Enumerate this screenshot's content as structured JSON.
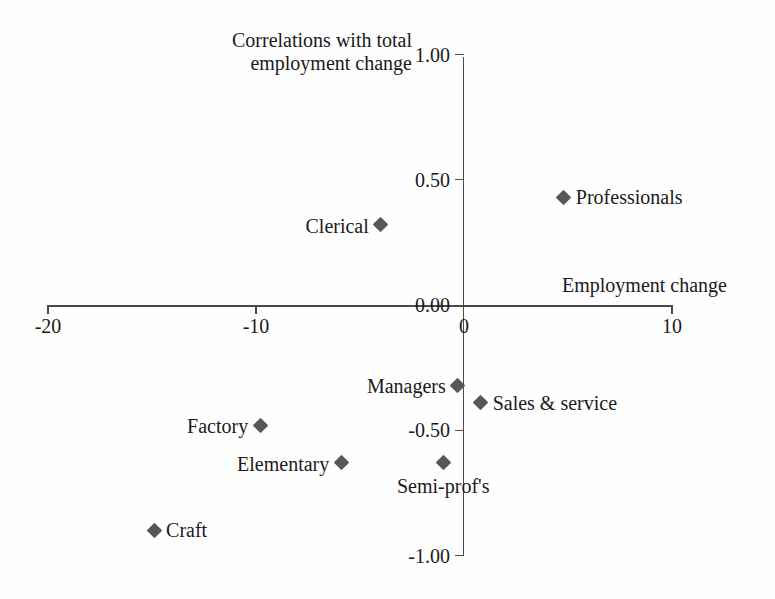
{
  "chart_data": {
    "type": "scatter",
    "title": "",
    "xlabel": "Employment change",
    "ylabel": "Correlations with total employment change",
    "ylabel_line1": "Correlations with total",
    "ylabel_line2": "employment change",
    "xlim": [
      -20,
      10
    ],
    "ylim": [
      -1.0,
      1.0
    ],
    "grid": false,
    "legend": "none",
    "marker_color": "#575757",
    "axis_color": "#4a4a4a",
    "background_color": "#fefefe",
    "xticks": [
      {
        "value": -20,
        "label": "-20"
      },
      {
        "value": -10,
        "label": "-10"
      },
      {
        "value": 0,
        "label": "0"
      },
      {
        "value": 10,
        "label": "10"
      }
    ],
    "yticks": [
      {
        "value": 1.0,
        "label": "1.00"
      },
      {
        "value": 0.5,
        "label": "0.50"
      },
      {
        "value": 0.0,
        "label": "0.00"
      },
      {
        "value": -0.5,
        "label": "-0.50"
      },
      {
        "value": -1.0,
        "label": "-1.00"
      }
    ],
    "points": [
      {
        "label": "Professionals",
        "x": 4.8,
        "y": 0.43,
        "label_pos": "right"
      },
      {
        "label": "Clerical",
        "x": -4.0,
        "y": 0.32,
        "label_pos": "left"
      },
      {
        "label": "Managers",
        "x": -0.3,
        "y": -0.32,
        "label_pos": "left"
      },
      {
        "label": "Sales & service",
        "x": 0.8,
        "y": -0.39,
        "label_pos": "right"
      },
      {
        "label": "Factory",
        "x": -9.8,
        "y": -0.48,
        "label_pos": "left"
      },
      {
        "label": "Elementary",
        "x": -5.9,
        "y": -0.63,
        "label_pos": "left"
      },
      {
        "label": "Semi-prof's",
        "x": -1.0,
        "y": -0.63,
        "label_pos": "below"
      },
      {
        "label": "Craft",
        "x": -14.9,
        "y": -0.9,
        "label_pos": "right"
      }
    ]
  }
}
